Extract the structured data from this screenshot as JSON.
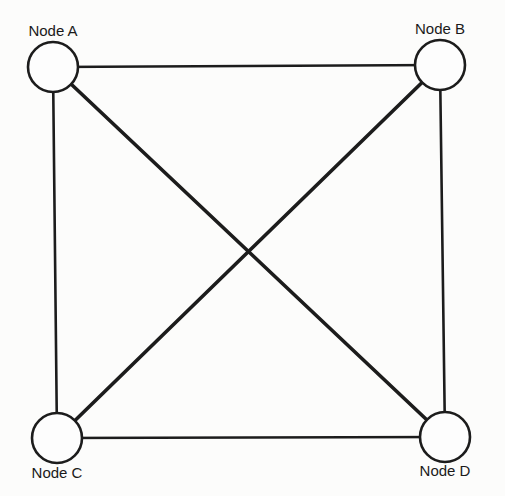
{
  "diagram": {
    "type": "complete-graph",
    "nodes": [
      {
        "id": "A",
        "label": "Node A",
        "cx": 53,
        "cy": 67,
        "r": 25,
        "label_x": 53,
        "label_y": 36
      },
      {
        "id": "B",
        "label": "Node B",
        "cx": 440,
        "cy": 65,
        "r": 25,
        "label_x": 440,
        "label_y": 34
      },
      {
        "id": "C",
        "label": "Node C",
        "cx": 57,
        "cy": 438,
        "r": 25,
        "label_x": 57,
        "label_y": 478
      },
      {
        "id": "D",
        "label": "Node D",
        "cx": 445,
        "cy": 437,
        "r": 25,
        "label_x": 445,
        "label_y": 476
      }
    ],
    "edges": [
      {
        "from": "A",
        "to": "B",
        "style": "side"
      },
      {
        "from": "A",
        "to": "C",
        "style": "side"
      },
      {
        "from": "B",
        "to": "D",
        "style": "side"
      },
      {
        "from": "C",
        "to": "D",
        "style": "side"
      },
      {
        "from": "A",
        "to": "D",
        "style": "diag"
      },
      {
        "from": "B",
        "to": "C",
        "style": "diag"
      }
    ],
    "colors": {
      "stroke": "#1c1c1c",
      "background": "#fcfcfb"
    }
  }
}
